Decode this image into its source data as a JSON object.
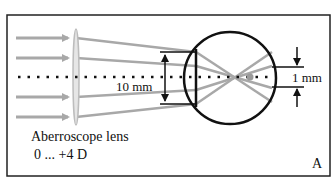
{
  "figure": {
    "panel_label": "A",
    "lens_label_line1": "Aberroscope lens",
    "lens_label_line2": "0 ... +4 D",
    "pupil_dimension": "10 mm",
    "retina_dimension": "1 mm"
  },
  "colors": {
    "frame": "#222222",
    "rays": "#a8a8a8",
    "lens": "#c4c4c4",
    "eye": "#111111",
    "axis": "#111111"
  },
  "elements": {
    "rays": [
      "ray-1",
      "ray-2",
      "ray-3",
      "ray-4"
    ],
    "optical_axis": "dotted",
    "eye": "circle with cornea/lens plane",
    "focus_point": "gray dot"
  }
}
